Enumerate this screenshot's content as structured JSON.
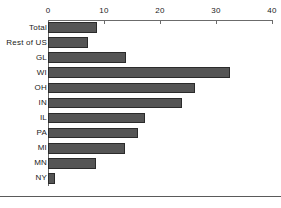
{
  "chart_data": {
    "type": "bar",
    "orientation": "horizontal",
    "title": "",
    "subtitle": "",
    "xlabel": "",
    "ylabel": "",
    "xlim": [
      0,
      40
    ],
    "xticks": [
      0,
      10,
      20,
      30,
      40
    ],
    "xtick_labels": [
      "0",
      "10",
      "20",
      "30",
      "40"
    ],
    "grid": false,
    "legend": null,
    "axis_position": "top",
    "bar_color": "#555555",
    "bar_edge_color": "#2b2b2b",
    "axis_color": "#6b6b6b",
    "categories": [
      "Total",
      "Rest of US",
      "GL",
      "WI",
      "OH",
      "IN",
      "IL",
      "PA",
      "MI",
      "MN",
      "NY"
    ],
    "values": [
      8.8,
      7.1,
      14.0,
      32.5,
      26.3,
      23.9,
      17.3,
      16.1,
      13.8,
      8.6,
      1.2
    ]
  }
}
